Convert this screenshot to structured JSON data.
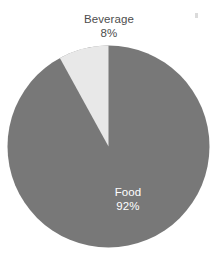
{
  "canvas": {
    "width": 218,
    "height": 266,
    "background": "#ffffff"
  },
  "chart_data": {
    "type": "pie",
    "title": "",
    "subtitle": "",
    "xlabel": "",
    "ylabel": "",
    "legend_position": "none",
    "grid": false,
    "units": "percent",
    "start_angle_deg": 0,
    "direction": "clockwise",
    "categories": [
      "Food",
      "Beverage"
    ],
    "values": [
      92,
      8
    ],
    "labels": [
      "92%",
      "8%"
    ],
    "colors": [
      "#787878",
      "#e8e8e8"
    ],
    "slices": [
      {
        "name": "Food",
        "value": 92,
        "value_label": "92%",
        "color": "#787878",
        "label_placement": "inside",
        "label_color": "#ffffff"
      },
      {
        "name": "Beverage",
        "value": 8,
        "value_label": "8%",
        "color": "#e8e8e8",
        "label_placement": "outside-top",
        "label_color": "#4d4d4d"
      }
    ]
  },
  "geometry": {
    "center_x": 108.5,
    "center_y": 146.5,
    "radius": 101
  },
  "labels": {
    "beverage": {
      "name": "Beverage",
      "value": "8%"
    },
    "food": {
      "name": "Food",
      "value": "92%"
    }
  }
}
